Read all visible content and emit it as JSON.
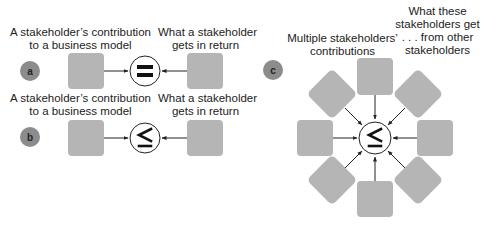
{
  "panels": {
    "a": {
      "label": "a",
      "left_caption": [
        "A stakeholder’s contribution",
        "to a business model"
      ],
      "right_caption": [
        "What a stakeholder",
        "gets in return"
      ],
      "operator": "="
    },
    "b": {
      "label": "b",
      "left_caption": [
        "A stakeholder’s contribution",
        "to a business model"
      ],
      "right_caption": [
        "What a stakeholder",
        "gets in return"
      ],
      "operator": "≤"
    },
    "c": {
      "label": "c",
      "left_caption": [
        "Multiple stakeholders’",
        "contributions"
      ],
      "right_caption": [
        "What these",
        "stakeholders get",
        ". . . from other",
        "stakeholders"
      ],
      "operator": "≤",
      "node_count": 8
    }
  },
  "colors": {
    "box": "#b5b5b5",
    "label_circle": "#8c8c8c",
    "line": "#222222"
  }
}
